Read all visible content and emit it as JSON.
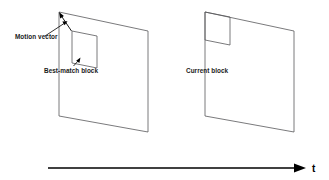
{
  "figure": {
    "kind": "block-matching-motion-estimation-diagram",
    "background_color": "#ffffff",
    "line_color": "#58585a",
    "annotation_color": "#000000"
  },
  "labels": {
    "motion_vector": "Motion vector",
    "best_match_block": "Best-match block",
    "current_block": "Current block",
    "time_axis": "t"
  },
  "frames": {
    "reference_frame": {
      "name": "reference-frame",
      "points": "59,12 148,31 148,132 59,116"
    },
    "current_frame": {
      "name": "current-frame",
      "points": "205,12 294,31 294,132 205,116"
    }
  },
  "blocks": {
    "best_match_block": {
      "name": "best-match-block",
      "points": "72,31 97,36 97,68 72,63"
    },
    "current_block": {
      "name": "current-block",
      "points": "205,12 230,17 230,45 205,40"
    }
  },
  "annotations": {
    "motion_vector_arrow": {
      "from": "72,31",
      "to": "59,12"
    },
    "motion_vector_leader": {
      "from": "46,36",
      "to": "66,22"
    },
    "best_match_leader": {
      "from": "78,60",
      "to": "72,67"
    },
    "time_axis": {
      "from_x": 48,
      "to_x": 305,
      "y": 168
    }
  }
}
